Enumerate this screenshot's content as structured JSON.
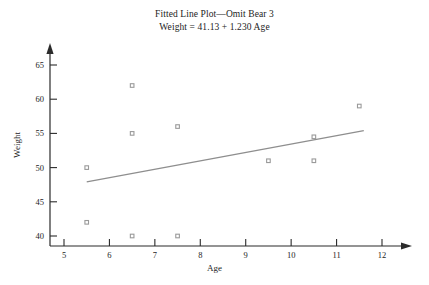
{
  "chart_data": {
    "type": "scatter",
    "title": "Fitted Line Plot—Omit Bear 3",
    "subtitle": "Weight = 41.13 + 1.230 Age",
    "xlabel": "Age",
    "ylabel": "Weight",
    "xlim": [
      4.5,
      12.5
    ],
    "ylim": [
      38.0,
      66.5
    ],
    "xticks": [
      5,
      6,
      7,
      8,
      9,
      10,
      11,
      12
    ],
    "yticks": [
      40,
      45,
      50,
      55,
      60,
      65
    ],
    "grid": false,
    "legend": null,
    "marker_color": "#9a9a9a",
    "line_color": "#8e8e8e",
    "axis_color": "#2b2b2b",
    "points": [
      {
        "x": 5.5,
        "y": 50.0
      },
      {
        "x": 5.5,
        "y": 42.0
      },
      {
        "x": 6.5,
        "y": 62.0
      },
      {
        "x": 6.5,
        "y": 55.0
      },
      {
        "x": 6.5,
        "y": 40.0
      },
      {
        "x": 7.5,
        "y": 56.0
      },
      {
        "x": 7.5,
        "y": 40.0
      },
      {
        "x": 9.5,
        "y": 51.0
      },
      {
        "x": 10.5,
        "y": 54.5
      },
      {
        "x": 10.5,
        "y": 51.0
      },
      {
        "x": 11.5,
        "y": 59.0
      }
    ],
    "fit_line": {
      "intercept": 41.13,
      "slope": 1.23,
      "x_start": 5.5,
      "x_end": 11.6,
      "y_start": 47.9,
      "y_end": 55.4
    }
  }
}
